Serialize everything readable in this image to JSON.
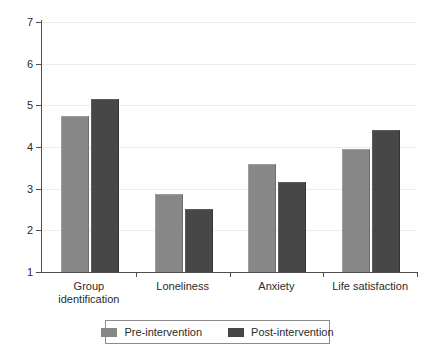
{
  "chart_data": {
    "type": "bar",
    "title": "",
    "subtitle": "",
    "xlabel": "",
    "ylabel": "",
    "ylim": [
      1,
      7
    ],
    "yticks": [
      1,
      2,
      3,
      4,
      5,
      6,
      7
    ],
    "ytick_labels": [
      "1",
      "2",
      "3",
      "4",
      "5",
      "6",
      "7"
    ],
    "grid": true,
    "grid_axis": "y",
    "legend_position": "bottom",
    "categories": [
      "Group identification",
      "Loneliness",
      "Anxiety",
      "Life satisfaction"
    ],
    "category_labels": [
      "Group\nidentification",
      "Loneliness",
      "Anxiety",
      "Life satisfaction"
    ],
    "series": [
      {
        "name": "Pre-intervention",
        "color": "#878787",
        "values": [
          4.72,
          2.85,
          3.56,
          3.93
        ]
      },
      {
        "name": "Post-intervention",
        "color": "#474747",
        "values": [
          5.12,
          2.5,
          3.14,
          4.38
        ]
      }
    ]
  },
  "legend": {
    "entries": [
      {
        "label": "Pre-intervention",
        "swatch": "pre-intervention-swatch"
      },
      {
        "label": "Post-intervention",
        "swatch": "post-intervention-swatch"
      }
    ]
  },
  "colors": {
    "pre_intervention": "#878787",
    "post_intervention": "#474747",
    "axis": "#4d4d4d",
    "gridline": "#ececec",
    "text": "#2b2b2b",
    "background": "#ffffff"
  }
}
